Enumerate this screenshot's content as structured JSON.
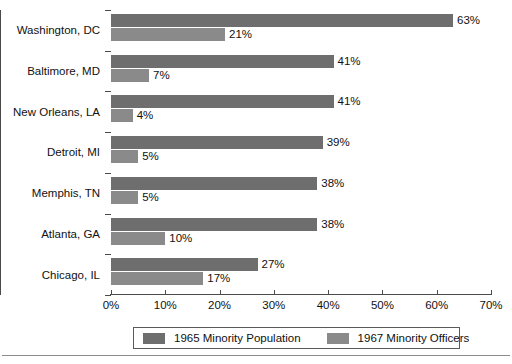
{
  "chart_data": {
    "type": "bar",
    "orientation": "horizontal",
    "title": "",
    "subtitle": "",
    "xlabel": "",
    "ylabel": "",
    "xlim": [
      0,
      70
    ],
    "xticks": [
      0,
      10,
      20,
      30,
      40,
      50,
      60,
      70
    ],
    "xtick_labels": [
      "0%",
      "10%",
      "20%",
      "30%",
      "40%",
      "50%",
      "60%",
      "70%"
    ],
    "grid": false,
    "legend_position": "bottom",
    "categories": [
      "Washington, DC",
      "Baltimore, MD",
      "New Orleans, LA",
      "Detroit, MI",
      "Memphis, TN",
      "Atlanta, GA",
      "Chicago, IL"
    ],
    "series": [
      {
        "name": "1965 Minority Population",
        "color": "#6e6e6e",
        "values": [
          63,
          41,
          41,
          39,
          38,
          38,
          27
        ],
        "labels": [
          "63%",
          "41%",
          "41%",
          "39%",
          "38%",
          "38%",
          "27%"
        ]
      },
      {
        "name": "1967 Minority Officers",
        "color": "#8a8a8a",
        "values": [
          21,
          7,
          4,
          5,
          5,
          10,
          17
        ],
        "labels": [
          "21%",
          "7%",
          "4%",
          "5%",
          "5%",
          "10%",
          "17%"
        ]
      }
    ]
  },
  "legend": {
    "entries": [
      {
        "label": "1965 Minority Population",
        "color": "#6e6e6e"
      },
      {
        "label": "1967 Minority Officers",
        "color": "#8a8a8a"
      }
    ]
  },
  "axis": {
    "tick_labels": [
      "0%",
      "10%",
      "20%",
      "30%",
      "40%",
      "50%",
      "60%",
      "70%"
    ]
  }
}
